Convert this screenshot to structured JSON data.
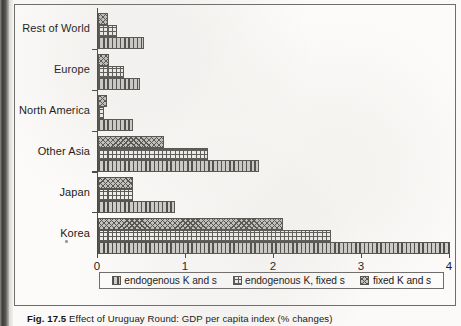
{
  "figure": {
    "caption_label": "Fig. 17.5",
    "caption_text": "Effect of Uruguay Round: GDP per capita index (% changes)"
  },
  "legend": {
    "position": "bottom",
    "items": [
      {
        "label": "endogenous K and s",
        "pattern": "vertical-lines",
        "color": "#b3b1ad"
      },
      {
        "label": "endogenous K, fixed s",
        "pattern": "dotted-grid",
        "color": "#f2f0ed"
      },
      {
        "label": "fixed K and s",
        "pattern": "cross-hatch",
        "color": "#c3c1bd"
      }
    ]
  },
  "axes": {
    "x_ticks": [
      "0",
      "1",
      "2",
      "3",
      "4"
    ],
    "x_min": 0,
    "x_max": 4,
    "y_categories": [
      "Rest of World",
      "Europe",
      "North America",
      "Other Asia",
      "Japan",
      "Korea"
    ]
  },
  "chart_data": {
    "type": "bar",
    "orientation": "horizontal",
    "title": "Effect of Uruguay Round: GDP per capita index (% changes)",
    "xlabel": "",
    "ylabel": "",
    "xlim": [
      0,
      4
    ],
    "grid": false,
    "legend_position": "bottom",
    "categories": [
      "Rest of World",
      "Europe",
      "North America",
      "Other Asia",
      "Japan",
      "Korea"
    ],
    "series": [
      {
        "name": "endogenous K and s",
        "pattern": "vertical-lines",
        "values": [
          0.52,
          0.48,
          0.4,
          1.83,
          0.88,
          4.0
        ]
      },
      {
        "name": "endogenous K, fixed s",
        "pattern": "dotted-grid",
        "values": [
          0.22,
          0.3,
          0.07,
          1.25,
          0.4,
          2.65
        ]
      },
      {
        "name": "fixed K and s",
        "pattern": "cross-hatch",
        "values": [
          0.11,
          0.12,
          0.1,
          0.75,
          0.4,
          2.1
        ]
      }
    ]
  }
}
